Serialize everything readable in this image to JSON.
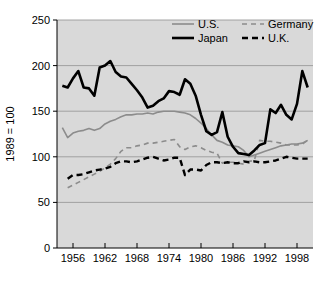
{
  "chart_data": {
    "type": "line",
    "title": "",
    "xlabel": "",
    "ylabel": "1989 = 100",
    "xlim": [
      1953,
      2001
    ],
    "ylim": [
      0,
      250
    ],
    "grid": true,
    "legend_position": "top-right",
    "y_ticks": [
      0,
      50,
      100,
      150,
      200,
      250
    ],
    "x_ticks": [
      1956,
      1962,
      1968,
      1974,
      1980,
      1986,
      1992,
      1998
    ],
    "x_tick_labels": [
      "1956",
      "1962",
      "1968",
      "1974",
      "1980",
      "1986",
      "1992",
      "1998"
    ],
    "y_tick_labels": [
      "0",
      "50",
      "100",
      "150",
      "200",
      "250"
    ],
    "plot_background": "#d9d9d9",
    "page_background": "#ffffff",
    "gridline_color": "#9a9a9a",
    "series": [
      {
        "name": "U.S.",
        "color": "#8c8c8c",
        "style": "solid",
        "width": 1.6,
        "x": [
          1954,
          1955,
          1956,
          1957,
          1958,
          1959,
          1960,
          1961,
          1962,
          1963,
          1964,
          1965,
          1966,
          1967,
          1968,
          1969,
          1970,
          1971,
          1972,
          1973,
          1974,
          1975,
          1976,
          1977,
          1978,
          1979,
          1980,
          1981,
          1982,
          1983,
          1984,
          1985,
          1986,
          1987,
          1988,
          1989,
          1990,
          1991,
          1992,
          1993,
          1994,
          1995,
          1996,
          1997,
          1998,
          1999,
          2000
        ],
        "values": [
          132,
          121,
          126,
          128,
          129,
          131,
          129,
          131,
          136,
          139,
          141,
          144,
          146,
          146,
          147,
          147,
          148,
          147,
          149,
          150,
          150,
          150,
          149,
          148,
          146,
          142,
          137,
          131,
          124,
          118,
          116,
          113,
          112,
          111,
          107,
          100,
          102,
          104,
          106,
          108,
          110,
          112,
          113,
          114,
          114,
          115,
          118
        ]
      },
      {
        "name": "Germany",
        "color": "#8c8c8c",
        "style": "dashed",
        "width": 1.6,
        "dash": "5,4",
        "x": [
          1955,
          1956,
          1957,
          1958,
          1959,
          1960,
          1961,
          1962,
          1963,
          1964,
          1965,
          1966,
          1967,
          1968,
          1969,
          1970,
          1971,
          1972,
          1973,
          1974,
          1975,
          1976,
          1977,
          1978,
          1979,
          1980,
          1981,
          1982,
          1983,
          1984,
          1985,
          1986,
          1987,
          1988,
          1989,
          1990,
          1991,
          1992,
          1993,
          1994,
          1995,
          1996,
          1997,
          1998,
          1999,
          2000
        ],
        "values": [
          66,
          69,
          72,
          75,
          78,
          81,
          84,
          88,
          92,
          98,
          106,
          110,
          110,
          112,
          113,
          115,
          115,
          116,
          117,
          118,
          119,
          111,
          108,
          111,
          112,
          110,
          107,
          105,
          104,
          93,
          94,
          94,
          93,
          92,
          95,
          96,
          118,
          117,
          117,
          116,
          115,
          113,
          113,
          113,
          114,
          118
        ]
      },
      {
        "name": "Japan",
        "color": "#000000",
        "style": "solid",
        "width": 2.6,
        "x": [
          1954,
          1955,
          1956,
          1957,
          1958,
          1959,
          1960,
          1961,
          1962,
          1963,
          1964,
          1965,
          1966,
          1967,
          1968,
          1969,
          1970,
          1971,
          1972,
          1973,
          1974,
          1975,
          1976,
          1977,
          1978,
          1979,
          1980,
          1981,
          1982,
          1983,
          1984,
          1985,
          1986,
          1987,
          1988,
          1989,
          1990,
          1991,
          1992,
          1993,
          1994,
          1995,
          1996,
          1997,
          1998,
          1999,
          2000
        ],
        "values": [
          178,
          176,
          186,
          194,
          176,
          175,
          167,
          198,
          200,
          205,
          193,
          188,
          187,
          180,
          173,
          165,
          154,
          156,
          161,
          164,
          172,
          171,
          168,
          185,
          180,
          167,
          146,
          128,
          124,
          127,
          149,
          122,
          111,
          104,
          103,
          102,
          107,
          113,
          115,
          152,
          148,
          157,
          146,
          141,
          158,
          194,
          176
        ]
      },
      {
        "name": "U.K.",
        "color": "#000000",
        "style": "dashed",
        "width": 2.4,
        "dash": "6,4",
        "x": [
          1955,
          1956,
          1957,
          1958,
          1959,
          1960,
          1961,
          1962,
          1963,
          1964,
          1965,
          1966,
          1967,
          1968,
          1969,
          1970,
          1971,
          1972,
          1973,
          1974,
          1975,
          1976,
          1977,
          1978,
          1979,
          1980,
          1981,
          1982,
          1983,
          1984,
          1985,
          1986,
          1987,
          1988,
          1989,
          1990,
          1991,
          1992,
          1993,
          1994,
          1995,
          1996,
          1997,
          1998,
          1999,
          2000
        ],
        "values": [
          76,
          80,
          80,
          81,
          83,
          85,
          86,
          87,
          89,
          93,
          95,
          95,
          94,
          95,
          97,
          99,
          100,
          98,
          96,
          97,
          99,
          99,
          80,
          86,
          86,
          85,
          91,
          94,
          94,
          93,
          94,
          93,
          93,
          95,
          94,
          95,
          94,
          94,
          95,
          96,
          98,
          100,
          99,
          98,
          98,
          98
        ]
      }
    ]
  },
  "legend": {
    "entries": [
      {
        "label": "U.S."
      },
      {
        "label": "Germany"
      },
      {
        "label": "Japan"
      },
      {
        "label": "U.K."
      }
    ]
  },
  "y_axis": {
    "title": "1989 = 100"
  }
}
